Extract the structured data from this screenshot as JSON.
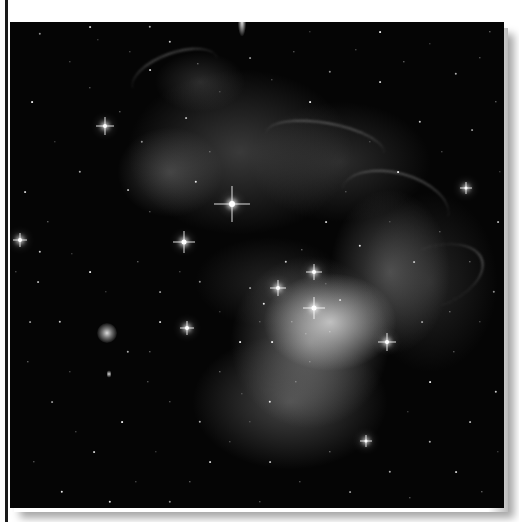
{
  "image": {
    "subject": "nebula-star-field-photograph",
    "palette": {
      "background": "#ffffff",
      "sky": "#050505",
      "nebula_bright": "#ebebeb",
      "nebula_dim": "#6e6e6e",
      "border": "#1a1a1a"
    }
  },
  "bright_stars": [
    {
      "x": 222,
      "y": 182,
      "size": 6,
      "spikes": 36
    },
    {
      "x": 174,
      "y": 220,
      "size": 5,
      "spikes": 22
    },
    {
      "x": 95,
      "y": 104,
      "size": 4,
      "spikes": 18
    },
    {
      "x": 304,
      "y": 286,
      "size": 5,
      "spikes": 22
    },
    {
      "x": 268,
      "y": 266,
      "size": 4,
      "spikes": 16
    },
    {
      "x": 304,
      "y": 250,
      "size": 4,
      "spikes": 16
    },
    {
      "x": 377,
      "y": 320,
      "size": 4,
      "spikes": 18
    },
    {
      "x": 10,
      "y": 218,
      "size": 4,
      "spikes": 14
    },
    {
      "x": 456,
      "y": 166,
      "size": 3,
      "spikes": 12
    },
    {
      "x": 177,
      "y": 306,
      "size": 4,
      "spikes": 14
    },
    {
      "x": 356,
      "y": 419,
      "size": 3,
      "spikes": 12
    }
  ],
  "galaxies": [
    {
      "x": 97,
      "y": 311,
      "w": 20,
      "h": 20
    },
    {
      "x": 99,
      "y": 352,
      "w": 4,
      "h": 9
    }
  ],
  "small_stars": [
    [
      30,
      12
    ],
    [
      60,
      40
    ],
    [
      80,
      66
    ],
    [
      22,
      80
    ],
    [
      45,
      120
    ],
    [
      70,
      150
    ],
    [
      15,
      170
    ],
    [
      38,
      200
    ],
    [
      62,
      232
    ],
    [
      28,
      260
    ],
    [
      50,
      300
    ],
    [
      18,
      340
    ],
    [
      42,
      380
    ],
    [
      66,
      410
    ],
    [
      24,
      440
    ],
    [
      52,
      470
    ],
    [
      88,
      18
    ],
    [
      120,
      30
    ],
    [
      140,
      48
    ],
    [
      110,
      90
    ],
    [
      132,
      120
    ],
    [
      118,
      168
    ],
    [
      140,
      190
    ],
    [
      128,
      240
    ],
    [
      150,
      270
    ],
    [
      118,
      330
    ],
    [
      138,
      360
    ],
    [
      112,
      400
    ],
    [
      146,
      430
    ],
    [
      126,
      460
    ],
    [
      160,
      20
    ],
    [
      188,
      42
    ],
    [
      210,
      70
    ],
    [
      176,
      96
    ],
    [
      200,
      130
    ],
    [
      186,
      160
    ],
    [
      240,
      36
    ],
    [
      262,
      58
    ],
    [
      284,
      30
    ],
    [
      300,
      80
    ],
    [
      320,
      50
    ],
    [
      346,
      28
    ],
    [
      370,
      60
    ],
    [
      394,
      40
    ],
    [
      420,
      22
    ],
    [
      446,
      52
    ],
    [
      470,
      36
    ],
    [
      486,
      80
    ],
    [
      462,
      108
    ],
    [
      432,
      130
    ],
    [
      410,
      100
    ],
    [
      388,
      150
    ],
    [
      360,
      120
    ],
    [
      336,
      170
    ],
    [
      316,
      200
    ],
    [
      350,
      224
    ],
    [
      380,
      200
    ],
    [
      404,
      240
    ],
    [
      430,
      210
    ],
    [
      460,
      240
    ],
    [
      484,
      270
    ],
    [
      470,
      300
    ],
    [
      444,
      330
    ],
    [
      420,
      360
    ],
    [
      398,
      390
    ],
    [
      420,
      420
    ],
    [
      446,
      450
    ],
    [
      472,
      470
    ],
    [
      488,
      430
    ],
    [
      460,
      400
    ],
    [
      486,
      370
    ],
    [
      440,
      290
    ],
    [
      412,
      300
    ],
    [
      300,
      340
    ],
    [
      286,
      360
    ],
    [
      260,
      380
    ],
    [
      240,
      400
    ],
    [
      220,
      420
    ],
    [
      200,
      440
    ],
    [
      180,
      460
    ],
    [
      160,
      480
    ],
    [
      260,
      440
    ],
    [
      290,
      460
    ],
    [
      320,
      430
    ],
    [
      340,
      470
    ],
    [
      380,
      450
    ],
    [
      400,
      476
    ],
    [
      230,
      320
    ],
    [
      210,
      290
    ],
    [
      250,
      300
    ],
    [
      276,
      240
    ],
    [
      292,
      228
    ],
    [
      316,
      262
    ],
    [
      330,
      278
    ],
    [
      282,
      300
    ],
    [
      254,
      282
    ],
    [
      240,
      266
    ],
    [
      296,
      312
    ],
    [
      320,
      310
    ],
    [
      262,
      320
    ],
    [
      190,
      260
    ],
    [
      170,
      250
    ],
    [
      150,
      300
    ],
    [
      210,
      350
    ],
    [
      232,
      372
    ],
    [
      190,
      400
    ],
    [
      160,
      380
    ],
    [
      140,
      330
    ],
    [
      20,
      300
    ],
    [
      6,
      250
    ],
    [
      30,
      230
    ],
    [
      80,
      250
    ],
    [
      96,
      270
    ],
    [
      60,
      350
    ],
    [
      84,
      430
    ],
    [
      100,
      480
    ],
    [
      130,
      500
    ],
    [
      200,
      495
    ],
    [
      250,
      480
    ],
    [
      300,
      495
    ],
    [
      350,
      500
    ],
    [
      420,
      500
    ],
    [
      470,
      495
    ],
    [
      370,
      10
    ],
    [
      300,
      10
    ],
    [
      140,
      5
    ],
    [
      80,
      5
    ],
    [
      480,
      10
    ],
    [
      490,
      150
    ],
    [
      488,
      200
    ]
  ],
  "filaments": [
    {
      "x": 120,
      "y": 30,
      "w": 90,
      "h": 40,
      "rot": -20
    },
    {
      "x": 255,
      "y": 100,
      "w": 120,
      "h": 40,
      "rot": 10
    },
    {
      "x": 330,
      "y": 150,
      "w": 110,
      "h": 60,
      "rot": 15
    },
    {
      "x": 390,
      "y": 200,
      "w": 60,
      "h": 110,
      "rot": 70
    }
  ]
}
